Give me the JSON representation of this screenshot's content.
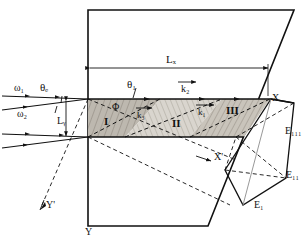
{
  "figure": {
    "type": "optical-beam-geometry-diagram"
  },
  "beams": {
    "omega1": "ω₁",
    "omega2": "ω₂"
  },
  "angles": {
    "theta_E": "θₑ",
    "theta_1": "θ₁",
    "phi": "Φ"
  },
  "dimensions": {
    "Lx": "Lₓ",
    "Ly": "Lᵧ"
  },
  "wavevectors": {
    "k1": "k₁",
    "k2": "k₂",
    "k3": "k₃"
  },
  "regions": {
    "one": "I",
    "two": "II",
    "three": "III"
  },
  "axes": {
    "x": "X",
    "x_prime": "X'",
    "y": "Y",
    "y_prime": "Y'"
  },
  "fields": {
    "E1": "E₁",
    "E2": "E₁₁",
    "E3": "E₁₁₁"
  },
  "colors": {
    "stroke": "#111111",
    "region_fill_dark": "#b9b4ab",
    "region_fill_light": "#d8d4cc",
    "region_fill_mid": "#c6c1b8",
    "background": "#ffffff"
  }
}
